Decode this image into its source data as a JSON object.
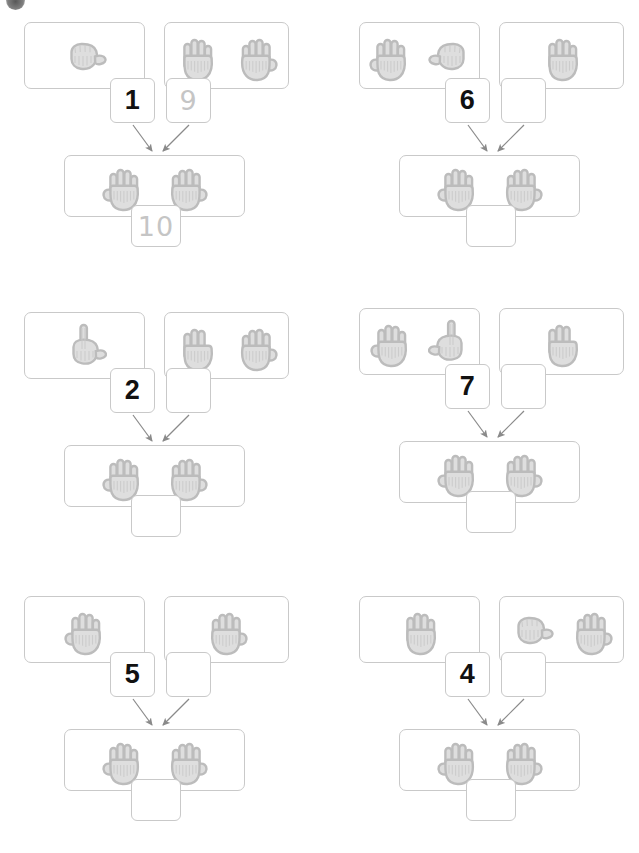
{
  "worksheet": {
    "title": "Making 10 with hands — number bonds worksheet",
    "corner_mark": "dark-circle-mark",
    "colors": {
      "box_border": "#c9c9c9",
      "hand_fill": "#dedede",
      "hand_outline": "#bcbcbc",
      "filled_number": "#111111",
      "traced_number": "#c5c5c5",
      "arrow": "#8a8a8a",
      "background": "#ffffff"
    },
    "target_total": 10
  },
  "problems": [
    {
      "id": 1,
      "position": "top-left",
      "addend_left": {
        "label": "1",
        "state": "filled",
        "hands": [
          {
            "fingers": 0,
            "type": "fist",
            "flip": false
          }
        ]
      },
      "addend_right": {
        "label": "9",
        "state": "traced",
        "hands": [
          {
            "fingers": 4,
            "type": "open",
            "flip": false
          },
          {
            "fingers": 5,
            "type": "open",
            "flip": true
          }
        ]
      },
      "sum": {
        "label": "10",
        "state": "traced",
        "hands": [
          {
            "fingers": 5,
            "type": "open",
            "flip": false
          },
          {
            "fingers": 5,
            "type": "open",
            "flip": true
          }
        ]
      }
    },
    {
      "id": 2,
      "position": "top-right",
      "addend_left": {
        "label": "6",
        "state": "filled",
        "hands": [
          {
            "fingers": 5,
            "type": "open",
            "flip": false
          },
          {
            "fingers": 0,
            "type": "fist",
            "flip": true
          }
        ]
      },
      "addend_right": {
        "label": "",
        "state": "empty",
        "hands": [
          {
            "fingers": 4,
            "type": "open",
            "flip": false
          }
        ]
      },
      "sum": {
        "label": "",
        "state": "empty",
        "hands": [
          {
            "fingers": 5,
            "type": "open",
            "flip": false
          },
          {
            "fingers": 5,
            "type": "open",
            "flip": true
          }
        ]
      }
    },
    {
      "id": 3,
      "position": "middle-left",
      "addend_left": {
        "label": "2",
        "state": "filled",
        "hands": [
          {
            "fingers": 1,
            "type": "point",
            "flip": false
          }
        ]
      },
      "addend_right": {
        "label": "",
        "state": "empty",
        "hands": [
          {
            "fingers": 3,
            "type": "open",
            "flip": false
          },
          {
            "fingers": 5,
            "type": "open",
            "flip": true
          }
        ]
      },
      "sum": {
        "label": "",
        "state": "empty",
        "hands": [
          {
            "fingers": 5,
            "type": "open",
            "flip": false
          },
          {
            "fingers": 5,
            "type": "open",
            "flip": true
          }
        ]
      }
    },
    {
      "id": 4,
      "position": "middle-right",
      "addend_left": {
        "label": "7",
        "state": "filled",
        "hands": [
          {
            "fingers": 5,
            "type": "open",
            "flip": false
          },
          {
            "fingers": 1,
            "type": "point",
            "flip": true
          }
        ]
      },
      "addend_right": {
        "label": "",
        "state": "empty",
        "hands": [
          {
            "fingers": 3,
            "type": "open",
            "flip": false
          }
        ]
      },
      "sum": {
        "label": "",
        "state": "empty",
        "hands": [
          {
            "fingers": 5,
            "type": "open",
            "flip": false
          },
          {
            "fingers": 5,
            "type": "open",
            "flip": true
          }
        ]
      }
    },
    {
      "id": 5,
      "position": "bottom-left",
      "addend_left": {
        "label": "5",
        "state": "filled",
        "hands": [
          {
            "fingers": 5,
            "type": "open",
            "flip": false
          }
        ]
      },
      "addend_right": {
        "label": "",
        "state": "empty",
        "hands": [
          {
            "fingers": 5,
            "type": "open",
            "flip": true
          }
        ]
      },
      "sum": {
        "label": "",
        "state": "empty",
        "hands": [
          {
            "fingers": 5,
            "type": "open",
            "flip": false
          },
          {
            "fingers": 5,
            "type": "open",
            "flip": true
          }
        ]
      }
    },
    {
      "id": 6,
      "position": "bottom-right",
      "addend_left": {
        "label": "4",
        "state": "filled",
        "hands": [
          {
            "fingers": 4,
            "type": "open",
            "flip": false
          }
        ]
      },
      "addend_right": {
        "label": "",
        "state": "empty",
        "hands": [
          {
            "fingers": 0,
            "type": "fist",
            "flip": false
          },
          {
            "fingers": 5,
            "type": "open",
            "flip": true
          }
        ]
      },
      "sum": {
        "label": "",
        "state": "empty",
        "hands": [
          {
            "fingers": 5,
            "type": "open",
            "flip": false
          },
          {
            "fingers": 5,
            "type": "open",
            "flip": true
          }
        ]
      }
    }
  ]
}
